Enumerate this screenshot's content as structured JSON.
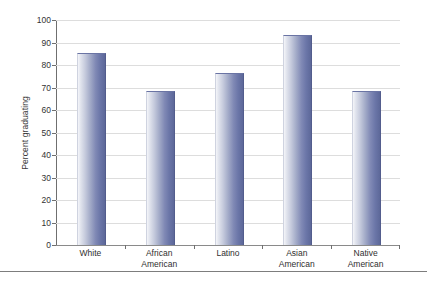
{
  "chart_data": {
    "type": "bar",
    "title": "",
    "subtitle": "",
    "xlabel": "",
    "ylabel": "Percent graduating",
    "categories": [
      "White",
      "African American",
      "Latino",
      "Asian American",
      "Native American"
    ],
    "values": [
      85,
      68,
      76,
      93,
      68
    ],
    "ylim": [
      0,
      100
    ],
    "ytick_labels": [
      "0",
      "10",
      "20",
      "30",
      "40",
      "50",
      "60",
      "70",
      "80",
      "90",
      "100"
    ],
    "ytick_values": [
      0,
      10,
      20,
      30,
      40,
      50,
      60,
      70,
      80,
      90,
      100
    ],
    "grid": "horizontal",
    "legend": "none",
    "series": [
      {
        "name": "Percent graduating",
        "values": [
          85,
          68,
          76,
          93,
          68
        ]
      }
    ],
    "bar_color_light": "#f4f5f9",
    "bar_color_dark": "#5d6899",
    "gridline_color": "#dddddd",
    "axis_color": "#6f6f6f"
  },
  "axis": {
    "y_title": "Percent graduating"
  },
  "x_labels": [
    {
      "line1": "White",
      "line2": ""
    },
    {
      "line1": "African",
      "line2": "American"
    },
    {
      "line1": "Latino",
      "line2": ""
    },
    {
      "line1": "Asian",
      "line2": "American"
    },
    {
      "line1": "Native",
      "line2": "American"
    }
  ]
}
